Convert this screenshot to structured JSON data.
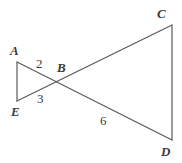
{
  "figure": {
    "type": "geometry-diagram",
    "background_color": "#ffffff",
    "stroke_color": "#5a5a5a",
    "text_color": "#3a3a3a",
    "stroke_width": 1.2,
    "vertices": [
      {
        "id": "A",
        "label": "A",
        "point_x": 17,
        "point_y": 62,
        "label_x": 10,
        "label_y": 44
      },
      {
        "id": "E",
        "label": "E",
        "point_x": 17,
        "point_y": 101,
        "label_x": 11,
        "label_y": 105
      },
      {
        "id": "B",
        "label": "B",
        "point_x": 57,
        "point_y": 79,
        "label_x": 57,
        "label_y": 61
      },
      {
        "id": "C",
        "label": "C",
        "point_x": 172,
        "point_y": 25,
        "label_x": 157,
        "label_y": 7
      },
      {
        "id": "D",
        "label": "D",
        "point_x": 172,
        "point_y": 140,
        "label_x": 161,
        "label_y": 145
      }
    ],
    "segments": [
      {
        "id": "AE",
        "from": "A",
        "to": "E",
        "x1": 17,
        "y1": 62,
        "x2": 17,
        "y2": 101
      },
      {
        "id": "AD",
        "from": "A",
        "to": "D",
        "x1": 17,
        "y1": 62,
        "x2": 172,
        "y2": 140
      },
      {
        "id": "EC",
        "from": "E",
        "to": "C",
        "x1": 17,
        "y1": 101,
        "x2": 172,
        "y2": 25
      },
      {
        "id": "CD",
        "from": "C",
        "to": "D",
        "x1": 172,
        "y1": 25,
        "x2": 172,
        "y2": 140
      }
    ],
    "angle_labels": [
      {
        "id": "angle-2",
        "label": "2",
        "label_x": 36,
        "label_y": 57
      },
      {
        "id": "angle-3",
        "label": "3",
        "label_x": 37,
        "label_y": 92
      },
      {
        "id": "angle-6",
        "label": "6",
        "label_x": 100,
        "label_y": 114
      }
    ]
  }
}
